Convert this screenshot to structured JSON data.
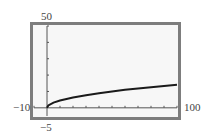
{
  "chart_data": {
    "type": "line",
    "title": "",
    "xlabel": "",
    "ylabel": "",
    "window": {
      "xmin": -10,
      "xmax": 100,
      "ymin": -5,
      "ymax": 50
    },
    "xlim": [
      -10,
      100
    ],
    "ylim": [
      -5,
      50
    ],
    "x_tick_interval": 10,
    "y_tick_interval": 10,
    "tick_labels": {
      "xmin": "−10",
      "xmax": "100",
      "ymin": "−5",
      "ymax": "50"
    },
    "grid": false,
    "legend": null,
    "series": [
      {
        "name": "curve",
        "x": [
          0,
          1,
          5,
          10,
          20,
          30,
          40,
          50,
          60,
          70,
          80,
          90,
          100
        ],
        "values": [
          0,
          1.4,
          3.2,
          4.5,
          6.3,
          7.7,
          8.9,
          10.0,
          11.0,
          11.8,
          12.6,
          13.4,
          14.1
        ]
      }
    ],
    "colors": {
      "frame": "#7d7d7d",
      "background": "#f7f7f7",
      "curve": "#1a1a1a",
      "axes": "#555555"
    }
  }
}
